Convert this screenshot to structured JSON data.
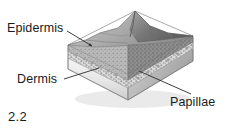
{
  "figure": {
    "number": "2.2",
    "style": "grayscale pencil/halftone anatomical illustration",
    "background_color": "#ffffff",
    "ink_color": "#1b1b1b"
  },
  "labels": {
    "epidermis": "Epidermis",
    "dermis": "Dermis",
    "papillae": "Papillae"
  },
  "callouts": [
    {
      "name": "epidermis",
      "text": "Epidermis",
      "text_x": 7,
      "text_y": 22,
      "leader_from_x": 67,
      "leader_from_y": 31,
      "leader_to_x": 92,
      "leader_to_y": 46,
      "arrowhead": true
    },
    {
      "name": "dermis",
      "text": "Dermis",
      "text_x": 17,
      "text_y": 73,
      "leader_from_x": 64,
      "leader_from_y": 79,
      "leader_to_x": 99,
      "leader_to_y": 68,
      "arrowhead": false
    },
    {
      "name": "papillae",
      "text": "Papillae",
      "text_x": 170,
      "text_y": 96,
      "leader_from_x": 139,
      "leader_from_y": 71,
      "leader_to_x": 191,
      "leader_to_y": 94,
      "arrowhead": false
    }
  ],
  "block": {
    "description": "rhomboid 3D block of skin seen in isometric view with raised ridged epidermal surface",
    "top_apex_x": 135,
    "top_apex_y": 11,
    "left_corner_x": 68,
    "left_corner_y": 69,
    "right_corner_x": 193,
    "right_corner_y": 61,
    "bottom_corner_x": 128,
    "bottom_corner_y": 100,
    "layers": [
      {
        "name": "epidermis",
        "tone": "#8c8c8c",
        "position": "upper textured ridge"
      },
      {
        "name": "papillae",
        "tone": "#b5b5b5",
        "position": "bumpy interface band"
      },
      {
        "name": "dermis",
        "tone": "#e2e2e2",
        "position": "lower pale slab"
      }
    ]
  },
  "colors": {
    "ink": "#1b1b1b",
    "leader_line": "#2a2a2a",
    "epidermis_dark": "#6f6f6f",
    "epidermis_mid": "#9a9a9a",
    "papillae_light": "#cfcfcf",
    "dermis_pale": "#ededed",
    "shadow": "#a8a8a8"
  }
}
